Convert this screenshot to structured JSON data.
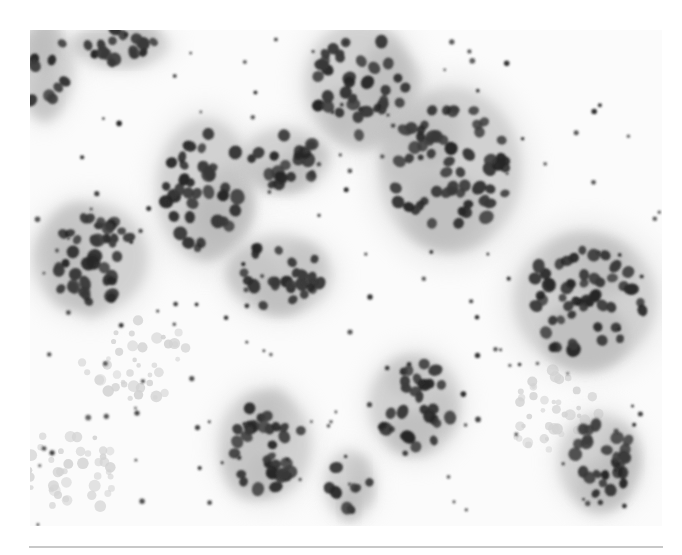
{
  "figure": {
    "kind": "micrograph",
    "colors": {
      "background": "#fbfbfb",
      "cytoplasm": "#b9b9b9",
      "nucleus": "#3a3a3a",
      "nucleus_dark": "#262626",
      "debris": "#d2d2d2",
      "dot": "#2a2a2a",
      "rule": "#c8c8c8"
    },
    "clusters": [
      {
        "name": "top-left-edge",
        "cx": 14,
        "cy": 40,
        "rx": 26,
        "ry": 42,
        "n": 10,
        "seed": 3
      },
      {
        "name": "top-left",
        "cx": 90,
        "cy": 15,
        "rx": 42,
        "ry": 20,
        "n": 18,
        "seed": 5
      },
      {
        "name": "top-center",
        "cx": 330,
        "cy": 55,
        "rx": 48,
        "ry": 55,
        "n": 34,
        "seed": 7
      },
      {
        "name": "middle-left",
        "cx": 175,
        "cy": 160,
        "rx": 42,
        "ry": 62,
        "n": 36,
        "seed": 11
      },
      {
        "name": "middle-left-right",
        "cx": 255,
        "cy": 130,
        "rx": 38,
        "ry": 28,
        "n": 20,
        "seed": 13
      },
      {
        "name": "center-right-ring",
        "cx": 420,
        "cy": 140,
        "rx": 62,
        "ry": 72,
        "n": 58,
        "seed": 17
      },
      {
        "name": "left",
        "cx": 60,
        "cy": 228,
        "rx": 50,
        "ry": 48,
        "n": 40,
        "seed": 19
      },
      {
        "name": "center",
        "cx": 250,
        "cy": 245,
        "rx": 45,
        "ry": 35,
        "n": 26,
        "seed": 23
      },
      {
        "name": "right",
        "cx": 555,
        "cy": 270,
        "rx": 62,
        "ry": 60,
        "n": 52,
        "seed": 29
      },
      {
        "name": "bottom-center-left",
        "cx": 235,
        "cy": 415,
        "rx": 40,
        "ry": 48,
        "n": 32,
        "seed": 31
      },
      {
        "name": "bottom-center",
        "cx": 385,
        "cy": 375,
        "rx": 40,
        "ry": 45,
        "n": 26,
        "seed": 37
      },
      {
        "name": "bottom-right",
        "cx": 570,
        "cy": 432,
        "rx": 36,
        "ry": 42,
        "n": 26,
        "seed": 41
      },
      {
        "name": "bottom-small",
        "cx": 320,
        "cy": 455,
        "rx": 22,
        "ry": 30,
        "n": 8,
        "seed": 43
      }
    ],
    "scattered_dots": 140,
    "debris_patches": [
      {
        "cx": 40,
        "cy": 440,
        "rx": 45,
        "ry": 50
      },
      {
        "cx": 110,
        "cy": 330,
        "rx": 60,
        "ry": 40
      },
      {
        "cx": 520,
        "cy": 380,
        "rx": 50,
        "ry": 40
      }
    ]
  },
  "separator": {
    "visible": true
  }
}
